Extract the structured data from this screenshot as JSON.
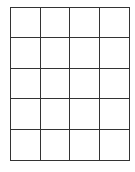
{
  "grid": {
    "columns": 4,
    "rows": 5,
    "line_color": "#333333",
    "background": "#ffffff",
    "cells": [
      [
        "",
        "",
        "",
        ""
      ],
      [
        "",
        "",
        "",
        ""
      ],
      [
        "",
        "",
        "",
        ""
      ],
      [
        "",
        "",
        "",
        ""
      ],
      [
        "",
        "",
        "",
        ""
      ]
    ]
  }
}
